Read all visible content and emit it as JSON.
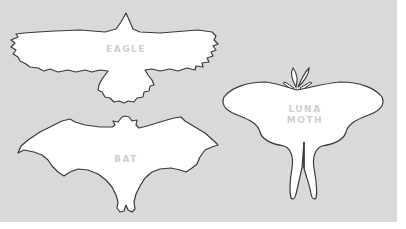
{
  "diagram": {
    "background_color": "#d9d9d9",
    "shape_fill": "#ffffff",
    "outline_color": "#3a3a3a",
    "label_color": "#cfcfcf",
    "silhouettes": [
      {
        "id": "eagle",
        "label": "EAGLE"
      },
      {
        "id": "bat",
        "label": "BAT"
      },
      {
        "id": "luna-moth",
        "label_line1": "LUNA",
        "label_line2": "MOTH"
      }
    ]
  }
}
